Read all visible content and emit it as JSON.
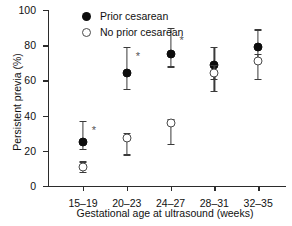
{
  "chart_data": {
    "type": "scatter",
    "title": "",
    "xlabel": "Gestational age at ultrasound (weeks)",
    "ylabel": "Persistent previa (%)",
    "categories": [
      "15–19",
      "20–23",
      "24–27",
      "28–31",
      "32–35"
    ],
    "ylim": [
      0,
      100
    ],
    "yticks": [
      0,
      20,
      40,
      60,
      80,
      100
    ],
    "ytick_labels": [
      "0",
      "20",
      "40",
      "60",
      "80",
      "100"
    ],
    "grid": false,
    "legend_position": "top-left-inside",
    "series": [
      {
        "name": "Prior cesarean",
        "marker": "filled-circle",
        "values": [
          25,
          64,
          75,
          68.5,
          79
        ],
        "ci_low": [
          21,
          55,
          68,
          61,
          72
        ],
        "ci_high": [
          37,
          79,
          90,
          79,
          89
        ]
      },
      {
        "name": "No prior cesarean",
        "marker": "open-circle",
        "values": [
          11,
          27,
          36,
          64,
          71
        ],
        "ci_low": [
          8,
          18,
          24,
          54,
          61
        ],
        "ci_high": [
          14,
          30,
          38,
          69,
          75
        ]
      }
    ],
    "annotations": [
      {
        "symbol": "*",
        "category": "15–19",
        "y": 32
      },
      {
        "symbol": "*",
        "category": "20–23",
        "y": 74
      },
      {
        "symbol": "*",
        "category": "24–27",
        "y": 83
      }
    ]
  },
  "legend": {
    "items": [
      {
        "label": "Prior cesarean",
        "marker": "filled-circle"
      },
      {
        "label": "No prior cesarean",
        "marker": "open-circle"
      }
    ]
  }
}
